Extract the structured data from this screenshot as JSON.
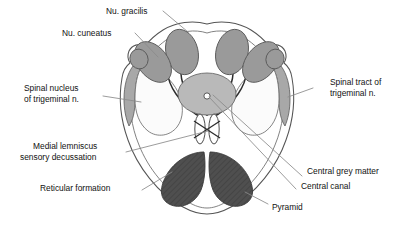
{
  "figure": {
    "labels": {
      "nu_gracilis": "Nu. gracilis",
      "nu_cuneatus": "Nu. cuneatus",
      "spinal_nucleus_line1": "Spinal nucleus",
      "spinal_nucleus_line2": "of trigeminal n.",
      "spinal_tract_line1": "Spinal tract of",
      "spinal_tract_line2": "trigeminal n.",
      "medial_lemniscus_line1": "Medial lemniscus",
      "medial_lemniscus_line2": "sensory decussation",
      "reticular_formation": "Reticular formation",
      "central_grey_matter": "Central grey matter",
      "central_canal": "Central canal",
      "pyramid": "Pyramid"
    },
    "colors": {
      "background": "#ffffff",
      "outline": "#555555",
      "nuclei_grey": "#9a9a9a",
      "central_grey": "#b9b9b9",
      "tract_grey": "#a8a8a8",
      "pyramid_dark": "#4f4f4f",
      "spinal_nucleus_fill": "#fbfbfb",
      "text": "#111111",
      "leader_line": "#777777"
    },
    "structures": [
      {
        "name": "nu-gracilis-left",
        "fill": "#9a9a9a"
      },
      {
        "name": "nu-gracilis-right",
        "fill": "#9a9a9a"
      },
      {
        "name": "nu-cuneatus-left",
        "fill": "#9a9a9a"
      },
      {
        "name": "nu-cuneatus-right",
        "fill": "#9a9a9a"
      },
      {
        "name": "accessory-cuneate-left",
        "fill": "#9a9a9a"
      },
      {
        "name": "accessory-cuneate-right",
        "fill": "#9a9a9a"
      },
      {
        "name": "central-grey-matter",
        "fill": "#b9b9b9"
      },
      {
        "name": "central-canal",
        "fill": "#ffffff"
      },
      {
        "name": "spinal-nucleus-trigeminal-left",
        "fill": "#fbfbfb"
      },
      {
        "name": "spinal-nucleus-trigeminal-right",
        "fill": "#fbfbfb"
      },
      {
        "name": "spinal-tract-trigeminal-left",
        "fill": "#a8a8a8"
      },
      {
        "name": "spinal-tract-trigeminal-right",
        "fill": "#a8a8a8"
      },
      {
        "name": "sensory-decussation-left",
        "fill": "#ffffff"
      },
      {
        "name": "sensory-decussation-right",
        "fill": "#ffffff"
      },
      {
        "name": "pyramid-left",
        "fill": "#4f4f4f"
      },
      {
        "name": "pyramid-right",
        "fill": "#4f4f4f"
      },
      {
        "name": "reticular-formation",
        "fill": "#ffffff"
      }
    ]
  }
}
